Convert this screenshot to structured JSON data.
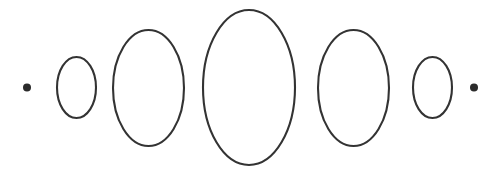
{
  "figure": {
    "title": "Ellipse size progression",
    "canvas": {
      "width": 501,
      "height": 175,
      "background_color": "#ffffff"
    },
    "style": {
      "stroke_color": "#333333",
      "fill_color": "#2b2b2b",
      "stroke_width": 2.1,
      "dot_fill_color": "#2b2b2b"
    },
    "baseline_y": 87.5,
    "element_count": 7
  },
  "chart_data": {
    "type": "scatter",
    "title": "Ellipse size progression",
    "xlabel": "",
    "ylabel": "",
    "grid": false,
    "legend": null,
    "xlim": [
      0,
      501
    ],
    "ylim": [
      0,
      175
    ],
    "categories": [
      "dot-left",
      "ellipse-small-left",
      "ellipse-medium-left",
      "ellipse-large-center",
      "ellipse-medium-right",
      "ellipse-small-right",
      "dot-right"
    ],
    "values": [
      8,
      61,
      116,
      155,
      116,
      61,
      8
    ],
    "series": [
      {
        "name": "height",
        "values": [
          8,
          61,
          116,
          155,
          116,
          61,
          8
        ]
      },
      {
        "name": "width",
        "values": [
          8,
          39,
          71,
          92,
          71,
          39,
          8
        ]
      },
      {
        "name": "center_x",
        "values": [
          27,
          76,
          148,
          249,
          353,
          432,
          474
        ]
      }
    ],
    "shapes": [
      {
        "name": "dot-left",
        "kind": "dot",
        "cx": 27,
        "cy": 87.5,
        "rx": 4,
        "ry": 4,
        "filled": true
      },
      {
        "name": "ellipse-small-left",
        "kind": "ellipse",
        "cx": 76.5,
        "cy": 87.5,
        "rx": 19.5,
        "ry": 30.5,
        "filled": false
      },
      {
        "name": "ellipse-medium-left",
        "kind": "ellipse",
        "cx": 148.5,
        "cy": 88,
        "rx": 35.5,
        "ry": 58,
        "filled": false
      },
      {
        "name": "ellipse-large-center",
        "kind": "ellipse",
        "cx": 249,
        "cy": 87.5,
        "rx": 46,
        "ry": 77.5,
        "filled": false
      },
      {
        "name": "ellipse-medium-right",
        "kind": "ellipse",
        "cx": 353.5,
        "cy": 88,
        "rx": 35.5,
        "ry": 58,
        "filled": false
      },
      {
        "name": "ellipse-small-right",
        "kind": "ellipse",
        "cx": 432.5,
        "cy": 87.5,
        "rx": 19.5,
        "ry": 30.5,
        "filled": false
      },
      {
        "name": "dot-right",
        "kind": "dot",
        "cx": 474,
        "cy": 87.5,
        "rx": 4,
        "ry": 4,
        "filled": true
      }
    ]
  }
}
